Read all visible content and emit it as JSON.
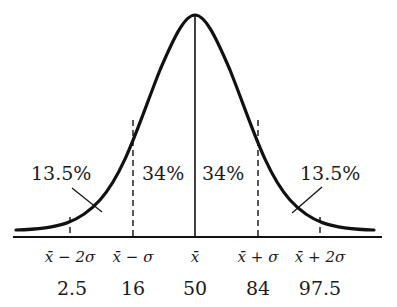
{
  "diagram": {
    "type": "normal-distribution",
    "colors": {
      "stroke": "#111111",
      "text": "#1a1a1a",
      "background": "#ffffff"
    },
    "region_labels": {
      "left_tail": "13.5%",
      "left_center": "34%",
      "right_center": "34%",
      "right_tail": "13.5%"
    },
    "axis_labels": [
      {
        "symbol": "x̄ − 2σ",
        "percentile": "2.5"
      },
      {
        "symbol": "x̄ − σ",
        "percentile": "16"
      },
      {
        "symbol": "x̄",
        "percentile": "50"
      },
      {
        "symbol": "x̄ + σ",
        "percentile": "84"
      },
      {
        "symbol": "x̄ + 2σ",
        "percentile": "97.5"
      }
    ]
  }
}
